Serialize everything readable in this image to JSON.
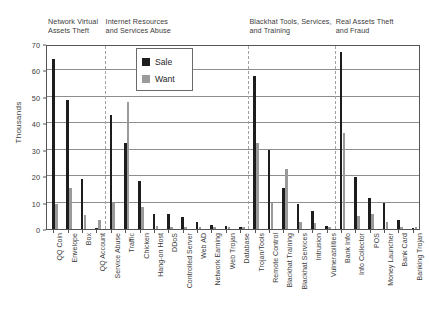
{
  "chart_data": {
    "type": "bar",
    "title": "",
    "xlabel": "",
    "ylabel": "Thousands",
    "ylim": [
      0,
      70
    ],
    "ytick_values": [
      0,
      10,
      20,
      30,
      40,
      50,
      60,
      70
    ],
    "ytick_labels": [
      "0",
      "10",
      "20",
      "30",
      "40",
      "50",
      "60",
      "70"
    ],
    "grid": true,
    "legend_position": "upper-center",
    "colors": {
      "sale": "#1d1d1d",
      "want": "#9a9a9a"
    },
    "series": [
      {
        "name": "Sale",
        "color": "#1d1d1d",
        "values": [
          64.5,
          49.0,
          18.8,
          0.4,
          43.0,
          32.5,
          18.0,
          5.5,
          5.5,
          4.5,
          2.5,
          1.5,
          1.2,
          0.8,
          57.8,
          30.0,
          15.7,
          9.6,
          6.7,
          1.0,
          66.8,
          19.8,
          11.8,
          9.8,
          3.3,
          0.5
        ]
      },
      {
        "name": "Want",
        "color": "#9a9a9a",
        "values": [
          9.6,
          15.7,
          5.2,
          3.4,
          9.7,
          48.0,
          8.5,
          1.0,
          0.9,
          0.9,
          0.8,
          0.7,
          0.6,
          0.6,
          32.5,
          10.0,
          22.7,
          2.8,
          2.3,
          0.9,
          36.5,
          4.9,
          5.5,
          2.6,
          0.8,
          0.6
        ]
      }
    ],
    "categories": [
      "QQ Coin",
      "Envelope",
      "Box",
      "QQ Account",
      "Service Abuse",
      "Traffic",
      "Chicken",
      "Hang-on Host",
      "DDoS",
      "Controlled Server",
      "Web AD",
      "Network Earning",
      "Web Trojan",
      "Database",
      "Trojan/Tools",
      "Remote Control",
      "Blackhat Training",
      "Blackhat Services",
      "Intrusion",
      "Vulnerabilities",
      "Bank Info",
      "Info Collector",
      "POS",
      "Money Launcher",
      "Bank Card",
      "Banking Trojan"
    ],
    "groups": [
      {
        "label": "Network Virtual\nAssets Theft",
        "start": 0,
        "end": 4
      },
      {
        "label": "Internet Resources\nand Services Abuse",
        "start": 4,
        "end": 14
      },
      {
        "label": "Blackhat Tools, Services,\nand Training",
        "start": 14,
        "end": 20
      },
      {
        "label": "Real Assets Theft\nand Fraud",
        "start": 20,
        "end": 26
      }
    ],
    "legend": [
      {
        "label": "Sale",
        "color": "#1d1d1d"
      },
      {
        "label": "Want",
        "color": "#9a9a9a"
      }
    ]
  }
}
